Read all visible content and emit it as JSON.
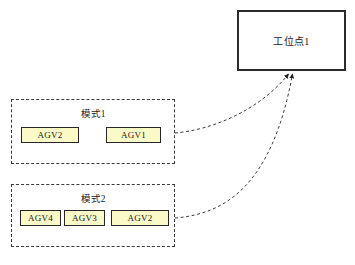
{
  "diagram": {
    "title_text": "",
    "background_color": "#ffffff"
  },
  "station": {
    "label": "工位点1",
    "border_color": "#2b2b2b",
    "fill_color": "#ffffff"
  },
  "modes": [
    {
      "title": "模式1",
      "border_style": "dashed",
      "agvs": [
        {
          "label": "AGV2"
        },
        {
          "label": "AGV1"
        }
      ]
    },
    {
      "title": "模式2",
      "border_style": "dashed",
      "agvs": [
        {
          "label": "AGV4"
        },
        {
          "label": "AGV3"
        },
        {
          "label": "AGV2"
        }
      ]
    }
  ],
  "agv_style": {
    "fill_color": "#fafac8",
    "border_color": "#26262a"
  },
  "connectors": [
    {
      "name": "mode1-to-station",
      "from": "模式1",
      "to": "工位点1",
      "style": "dashed",
      "arrowhead": true,
      "color": "#3a3a3a"
    },
    {
      "name": "mode2-to-station",
      "from": "模式2",
      "to": "工位点1",
      "style": "dashed",
      "arrowhead": true,
      "color": "#3a3a3a"
    }
  ]
}
